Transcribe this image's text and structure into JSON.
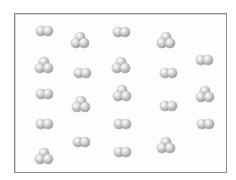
{
  "diagram": {
    "box": {
      "left": 14,
      "top": 13,
      "right": 226,
      "bottom": 172,
      "border_color": "#8a8a8a"
    },
    "atom_color": "#a9a9a9",
    "molecules": [
      {
        "type": "diatomic",
        "cx": 44,
        "cy": 31
      },
      {
        "type": "triatomic",
        "cx": 80,
        "cy": 40
      },
      {
        "type": "diatomic",
        "cx": 121,
        "cy": 32
      },
      {
        "type": "triatomic",
        "cx": 166,
        "cy": 40
      },
      {
        "type": "triatomic",
        "cx": 44,
        "cy": 65
      },
      {
        "type": "diatomic",
        "cx": 82,
        "cy": 73
      },
      {
        "type": "triatomic",
        "cx": 121,
        "cy": 65
      },
      {
        "type": "diatomic",
        "cx": 168,
        "cy": 73
      },
      {
        "type": "diatomic",
        "cx": 204,
        "cy": 60
      },
      {
        "type": "diatomic",
        "cx": 44,
        "cy": 94
      },
      {
        "type": "triatomic",
        "cx": 81,
        "cy": 104
      },
      {
        "type": "triatomic",
        "cx": 122,
        "cy": 93
      },
      {
        "type": "diatomic",
        "cx": 168,
        "cy": 106
      },
      {
        "type": "triatomic",
        "cx": 205,
        "cy": 94
      },
      {
        "type": "diatomic",
        "cx": 44,
        "cy": 124
      },
      {
        "type": "diatomic",
        "cx": 122,
        "cy": 124
      },
      {
        "type": "diatomic",
        "cx": 205,
        "cy": 124
      },
      {
        "type": "triatomic",
        "cx": 44,
        "cy": 156
      },
      {
        "type": "diatomic",
        "cx": 81,
        "cy": 142
      },
      {
        "type": "diatomic",
        "cx": 122,
        "cy": 152
      },
      {
        "type": "triatomic",
        "cx": 166,
        "cy": 145
      }
    ],
    "counts": {
      "diatomic": 12,
      "triatomic": 9
    }
  }
}
